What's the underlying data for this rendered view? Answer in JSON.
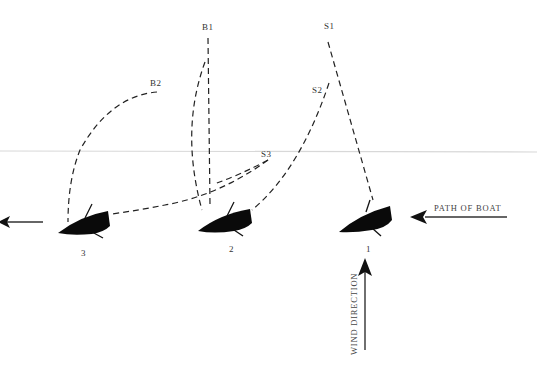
{
  "diagram": {
    "background": "#ffffff",
    "ink_color": "#111111",
    "guide_line_color": "#d8d8d8",
    "position_labels": {
      "B1": "B1",
      "B2": "B2",
      "S1": "S1",
      "S2": "S2",
      "S3": "S3"
    },
    "boats": [
      {
        "id": "1",
        "label": "1"
      },
      {
        "id": "2",
        "label": "2"
      },
      {
        "id": "3",
        "label": "3"
      }
    ],
    "arrows": {
      "path_of_boat": "PATH OF BOAT",
      "wind_direction": "WIND DIRECTION"
    }
  }
}
